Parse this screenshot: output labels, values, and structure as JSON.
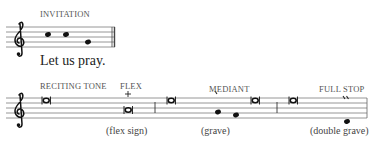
{
  "invitation": {
    "label": "INVITATION",
    "lyric": "Let us pray.",
    "notes": [
      "C5",
      "C5",
      "A4"
    ]
  },
  "tone": {
    "sections": [
      {
        "label": "RECITING TONE",
        "annotation": "",
        "mark": ""
      },
      {
        "label": "FLEX",
        "annotation": "(flex sign)",
        "mark": "+"
      },
      {
        "label": "MEDIANT",
        "annotation": "(grave)",
        "mark": "\\"
      },
      {
        "label": "FULL STOP",
        "annotation": "(double grave)",
        "mark": "\\\\"
      }
    ]
  },
  "colors": {
    "staff_line": "#888888",
    "note": "#111111",
    "label": "#555555"
  }
}
